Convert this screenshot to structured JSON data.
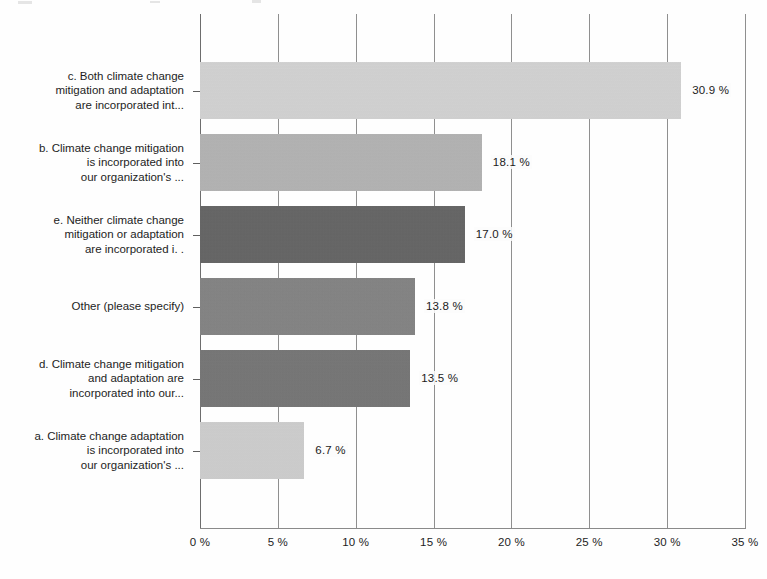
{
  "chart_data": {
    "type": "bar",
    "orientation": "horizontal",
    "title": "",
    "xlabel": "",
    "ylabel": "",
    "xlim": [
      0,
      35
    ],
    "xticks": [
      0,
      5,
      10,
      15,
      20,
      25,
      30,
      35
    ],
    "xtick_labels": [
      "0 %",
      "5 %",
      "10 %",
      "15 %",
      "20 %",
      "25 %",
      "30 %",
      "35 %"
    ],
    "grid": true,
    "legend": "none",
    "value_suffix": " %",
    "categories": [
      "c. Both climate change\nmitigation and adaptation\nare incorporated int...",
      "b. Climate change mitigation\nis incorporated into\nour organization's ...",
      "e. Neither climate change\nmitigation or adaptation\nare incorporated i. .",
      "Other (please specify)",
      "d. Climate change mitigation\nand adaptation are\nincorporated into our...",
      "a. Climate change adaptation\nis incorporated into\nour organization's ..."
    ],
    "values": [
      30.9,
      18.1,
      17.0,
      13.8,
      13.5,
      6.7
    ],
    "value_labels": [
      "30.9 %",
      "18.1 %",
      "17.0 %",
      "13.8 %",
      "13.5 %",
      "6.7 %"
    ],
    "bar_colors": [
      "#d6d6d6",
      "#b3b3b3",
      "#5c5c5c",
      "#7e7e7e",
      "#6f6f6f",
      "#d1d1d1"
    ]
  },
  "axis": {
    "line_color": "#8a8a8a",
    "grid_color": "#8f8f8f"
  }
}
